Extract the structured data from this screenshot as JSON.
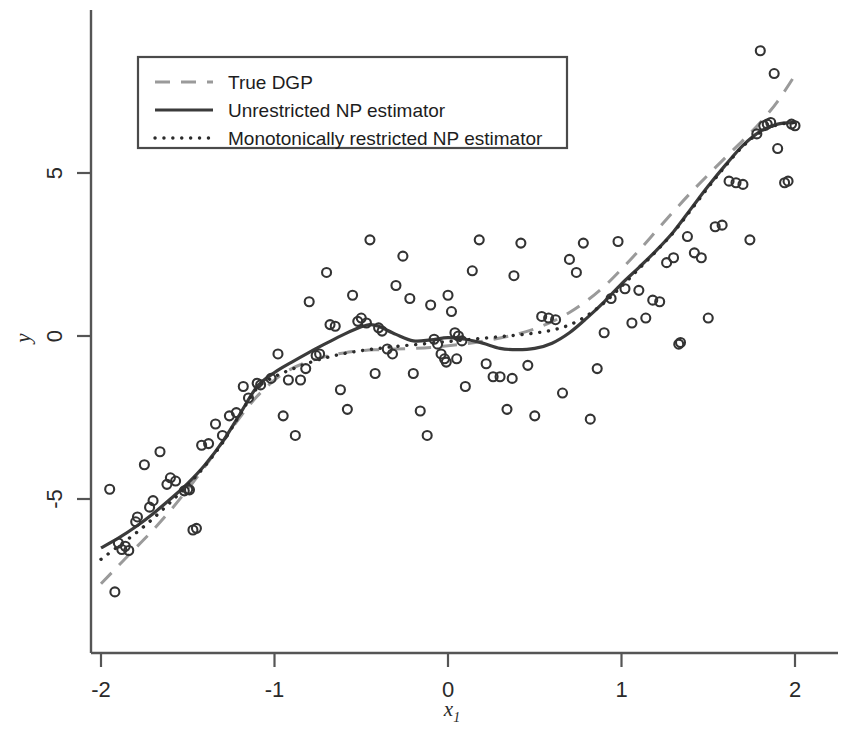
{
  "figure": {
    "kind": "scatter-with-regression-curves",
    "background": "#ffffff"
  },
  "axes": {
    "x_label": "x",
    "x_label_sub": "1",
    "y_label": "y",
    "x_ticks": [
      "-2",
      "-1",
      "0",
      "1",
      "2"
    ],
    "x_tick_values": [
      -2,
      -1,
      0,
      1,
      2
    ],
    "y_ticks": [
      "-5",
      "0",
      "5"
    ],
    "y_tick_values": [
      -5,
      0,
      5
    ],
    "x_range": [
      -2.0,
      2.0
    ],
    "y_range": [
      -9.1,
      9.6
    ],
    "spine_color": "#555555",
    "grid": false
  },
  "legend": {
    "position": "top-left",
    "border_color": "#4a4a4a",
    "items": [
      {
        "label": "True DGP",
        "style": "dashed",
        "color": "#9a9a9a"
      },
      {
        "label": "Unrestricted NP estimator",
        "style": "solid",
        "color": "#3b3b3b"
      },
      {
        "label": "Monotonically restricted NP estimator",
        "style": "dotted",
        "color": "#2b2b2b"
      }
    ]
  },
  "chart_data": {
    "type": "scatter",
    "title": "",
    "xlabel": "x1",
    "ylabel": "y",
    "xlim": [
      -2.0,
      2.0
    ],
    "ylim": [
      -9.1,
      9.6
    ],
    "grid": false,
    "legend_position": "top-left",
    "marker": {
      "shape": "open-circle",
      "size_px": 9,
      "edge_color": "#333333",
      "face_color": "none"
    },
    "points": [
      [
        -1.95,
        -4.7
      ],
      [
        -1.92,
        -7.85
      ],
      [
        -1.9,
        -6.35
      ],
      [
        -1.88,
        -6.55
      ],
      [
        -1.86,
        -6.45
      ],
      [
        -1.84,
        -6.58
      ],
      [
        -1.8,
        -5.7
      ],
      [
        -1.79,
        -5.55
      ],
      [
        -1.75,
        -3.95
      ],
      [
        -1.72,
        -5.25
      ],
      [
        -1.7,
        -5.05
      ],
      [
        -1.66,
        -3.55
      ],
      [
        -1.62,
        -4.55
      ],
      [
        -1.6,
        -4.35
      ],
      [
        -1.57,
        -4.45
      ],
      [
        -1.52,
        -4.75
      ],
      [
        -1.5,
        -4.7
      ],
      [
        -1.49,
        -4.72
      ],
      [
        -1.45,
        -5.9
      ],
      [
        -1.42,
        -3.35
      ],
      [
        -1.38,
        -3.3
      ],
      [
        -1.34,
        -2.7
      ],
      [
        -1.3,
        -3.05
      ],
      [
        -1.26,
        -2.45
      ],
      [
        -1.22,
        -2.35
      ],
      [
        -1.18,
        -1.55
      ],
      [
        -1.15,
        -1.9
      ],
      [
        -1.1,
        -1.45
      ],
      [
        -1.08,
        -1.5
      ],
      [
        -1.02,
        -1.3
      ],
      [
        -0.98,
        -0.55
      ],
      [
        -0.95,
        -2.45
      ],
      [
        -0.92,
        -1.35
      ],
      [
        -0.88,
        -3.05
      ],
      [
        -0.85,
        -1.35
      ],
      [
        -0.82,
        -1.0
      ],
      [
        -0.8,
        1.05
      ],
      [
        -0.76,
        -0.6
      ],
      [
        -0.74,
        -0.55
      ],
      [
        -0.7,
        1.95
      ],
      [
        -0.68,
        0.35
      ],
      [
        -0.65,
        0.3
      ],
      [
        -0.62,
        -1.65
      ],
      [
        -0.58,
        -2.25
      ],
      [
        -0.55,
        1.25
      ],
      [
        -0.52,
        0.45
      ],
      [
        -0.5,
        0.55
      ],
      [
        -0.47,
        0.4
      ],
      [
        -0.45,
        2.95
      ],
      [
        -0.42,
        -1.15
      ],
      [
        -0.4,
        0.25
      ],
      [
        -0.38,
        0.15
      ],
      [
        -0.35,
        -0.4
      ],
      [
        -0.32,
        -0.55
      ],
      [
        -0.3,
        1.55
      ],
      [
        -0.26,
        2.45
      ],
      [
        -0.22,
        1.15
      ],
      [
        -0.2,
        -1.15
      ],
      [
        -0.16,
        -2.3
      ],
      [
        -0.12,
        -3.05
      ],
      [
        -0.1,
        0.95
      ],
      [
        -0.08,
        -0.1
      ],
      [
        -0.06,
        -0.25
      ],
      [
        -0.04,
        -0.55
      ],
      [
        -0.02,
        -0.7
      ],
      [
        0.0,
        1.25
      ],
      [
        0.02,
        0.75
      ],
      [
        0.04,
        0.1
      ],
      [
        0.06,
        0.0
      ],
      [
        0.08,
        -0.15
      ],
      [
        0.1,
        -1.55
      ],
      [
        0.14,
        2.0
      ],
      [
        0.18,
        2.95
      ],
      [
        0.22,
        -0.85
      ],
      [
        0.26,
        -1.25
      ],
      [
        0.3,
        -1.25
      ],
      [
        0.34,
        -2.25
      ],
      [
        0.38,
        1.85
      ],
      [
        0.42,
        2.85
      ],
      [
        0.46,
        -0.9
      ],
      [
        0.5,
        -2.45
      ],
      [
        0.54,
        0.6
      ],
      [
        0.58,
        0.55
      ],
      [
        0.62,
        0.5
      ],
      [
        0.66,
        -1.75
      ],
      [
        0.7,
        2.35
      ],
      [
        0.74,
        1.95
      ],
      [
        0.78,
        2.85
      ],
      [
        0.82,
        -2.55
      ],
      [
        0.86,
        -1.0
      ],
      [
        0.9,
        0.1
      ],
      [
        0.94,
        1.15
      ],
      [
        0.98,
        2.9
      ],
      [
        1.02,
        1.45
      ],
      [
        1.06,
        0.4
      ],
      [
        1.1,
        1.4
      ],
      [
        1.14,
        0.55
      ],
      [
        1.18,
        1.1
      ],
      [
        1.22,
        1.05
      ],
      [
        1.26,
        2.25
      ],
      [
        1.3,
        2.4
      ],
      [
        1.34,
        -0.2
      ],
      [
        1.38,
        3.05
      ],
      [
        1.42,
        2.55
      ],
      [
        1.46,
        2.4
      ],
      [
        1.5,
        0.55
      ],
      [
        1.54,
        3.35
      ],
      [
        1.58,
        3.4
      ],
      [
        1.62,
        4.75
      ],
      [
        1.66,
        4.7
      ],
      [
        1.7,
        4.65
      ],
      [
        1.74,
        2.95
      ],
      [
        1.78,
        6.2
      ],
      [
        1.8,
        8.75
      ],
      [
        1.82,
        6.45
      ],
      [
        1.84,
        6.5
      ],
      [
        1.86,
        6.55
      ],
      [
        1.88,
        8.05
      ],
      [
        1.9,
        5.75
      ],
      [
        1.94,
        4.7
      ],
      [
        1.96,
        4.75
      ],
      [
        1.98,
        6.5
      ],
      [
        2.0,
        6.45
      ],
      [
        -0.01,
        -0.8
      ],
      [
        0.05,
        -0.7
      ],
      [
        1.33,
        -0.25
      ],
      [
        0.37,
        -1.3
      ],
      [
        -1.47,
        -5.95
      ]
    ],
    "series": [
      {
        "name": "True DGP",
        "style": "dashed",
        "color": "#9a9a9a",
        "width": 3,
        "x": [
          -2.0,
          -1.9,
          -1.8,
          -1.7,
          -1.6,
          -1.5,
          -1.4,
          -1.3,
          -1.2,
          -1.1,
          -1.0,
          -0.9,
          -0.8,
          -0.7,
          -0.6,
          -0.5,
          -0.4,
          -0.3,
          -0.2,
          -0.1,
          0.0,
          0.1,
          0.2,
          0.3,
          0.4,
          0.5,
          0.6,
          0.7,
          0.8,
          0.9,
          1.0,
          1.1,
          1.2,
          1.3,
          1.4,
          1.5,
          1.6,
          1.7,
          1.8,
          1.9,
          2.0
        ],
        "y": [
          -7.6,
          -7.05,
          -6.5,
          -5.95,
          -5.35,
          -4.7,
          -4.0,
          -3.25,
          -2.5,
          -1.85,
          -1.35,
          -1.0,
          -0.78,
          -0.62,
          -0.52,
          -0.45,
          -0.42,
          -0.4,
          -0.38,
          -0.35,
          -0.3,
          -0.24,
          -0.16,
          -0.06,
          0.06,
          0.22,
          0.44,
          0.72,
          1.08,
          1.52,
          2.05,
          2.62,
          3.22,
          3.82,
          4.4,
          4.95,
          5.48,
          6.0,
          6.55,
          7.2,
          8.0
        ]
      },
      {
        "name": "Unrestricted NP estimator",
        "style": "solid",
        "color": "#3b3b3b",
        "width": 3.2,
        "x": [
          -2.0,
          -1.9,
          -1.8,
          -1.7,
          -1.6,
          -1.5,
          -1.4,
          -1.3,
          -1.2,
          -1.1,
          -1.0,
          -0.9,
          -0.8,
          -0.7,
          -0.6,
          -0.5,
          -0.45,
          -0.4,
          -0.3,
          -0.2,
          -0.1,
          0.0,
          0.1,
          0.2,
          0.3,
          0.4,
          0.5,
          0.6,
          0.7,
          0.8,
          0.9,
          1.0,
          1.1,
          1.2,
          1.3,
          1.4,
          1.5,
          1.6,
          1.7,
          1.8,
          1.9,
          2.0
        ],
        "y": [
          -6.5,
          -6.2,
          -5.85,
          -5.45,
          -5.0,
          -4.52,
          -3.95,
          -3.25,
          -2.4,
          -1.55,
          -1.12,
          -0.8,
          -0.5,
          -0.22,
          0.05,
          0.28,
          0.35,
          0.3,
          0.05,
          -0.15,
          -0.12,
          -0.05,
          -0.1,
          -0.22,
          -0.38,
          -0.42,
          -0.38,
          -0.22,
          0.1,
          0.55,
          1.05,
          1.6,
          2.1,
          2.62,
          3.2,
          3.9,
          4.6,
          5.25,
          5.85,
          6.28,
          6.5,
          6.55
        ]
      },
      {
        "name": "Monotonically restricted NP estimator",
        "style": "dotted",
        "color": "#2b2b2b",
        "width": 3.4,
        "x": [
          -2.0,
          -1.9,
          -1.8,
          -1.7,
          -1.6,
          -1.5,
          -1.4,
          -1.3,
          -1.2,
          -1.1,
          -1.0,
          -0.9,
          -0.8,
          -0.7,
          -0.6,
          -0.5,
          -0.4,
          -0.3,
          -0.2,
          -0.1,
          0.0,
          0.1,
          0.2,
          0.3,
          0.4,
          0.5,
          0.6,
          0.7,
          0.8,
          0.9,
          1.0,
          1.1,
          1.2,
          1.3,
          1.4,
          1.5,
          1.6,
          1.7,
          1.8,
          1.9,
          2.0
        ],
        "y": [
          -6.85,
          -6.45,
          -6.05,
          -5.6,
          -5.1,
          -4.58,
          -3.98,
          -3.28,
          -2.42,
          -1.6,
          -1.25,
          -1.02,
          -0.82,
          -0.66,
          -0.54,
          -0.45,
          -0.38,
          -0.32,
          -0.27,
          -0.22,
          -0.17,
          -0.12,
          -0.07,
          -0.02,
          0.03,
          0.09,
          0.18,
          0.34,
          0.62,
          1.02,
          1.52,
          2.06,
          2.6,
          3.18,
          3.86,
          4.56,
          5.22,
          5.82,
          6.25,
          6.48,
          6.55
        ]
      }
    ]
  }
}
